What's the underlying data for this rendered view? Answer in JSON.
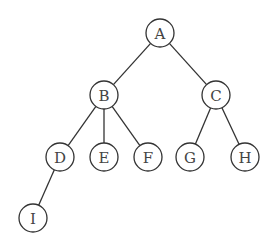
{
  "diagram": {
    "type": "tree",
    "nodes": [
      {
        "id": "A",
        "label": "A",
        "x": 160,
        "y": 33
      },
      {
        "id": "B",
        "label": "B",
        "x": 104,
        "y": 95
      },
      {
        "id": "C",
        "label": "C",
        "x": 216,
        "y": 95
      },
      {
        "id": "D",
        "label": "D",
        "x": 60,
        "y": 157
      },
      {
        "id": "E",
        "label": "E",
        "x": 104,
        "y": 157
      },
      {
        "id": "F",
        "label": "F",
        "x": 148,
        "y": 157
      },
      {
        "id": "G",
        "label": "G",
        "x": 190,
        "y": 157
      },
      {
        "id": "H",
        "label": "H",
        "x": 245,
        "y": 157
      },
      {
        "id": "I",
        "label": "I",
        "x": 33,
        "y": 218
      }
    ],
    "edges": [
      [
        "A",
        "B"
      ],
      [
        "A",
        "C"
      ],
      [
        "B",
        "D"
      ],
      [
        "B",
        "E"
      ],
      [
        "B",
        "F"
      ],
      [
        "C",
        "G"
      ],
      [
        "C",
        "H"
      ],
      [
        "D",
        "I"
      ]
    ],
    "node_radius": 14
  }
}
